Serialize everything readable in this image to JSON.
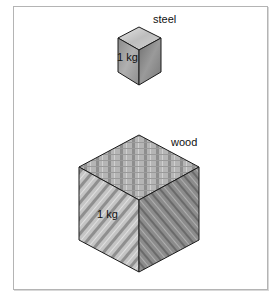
{
  "figure": {
    "objects": [
      {
        "material": "steel",
        "mass_label": "1 kg",
        "size": "small"
      },
      {
        "material": "wood",
        "mass_label": "1 kg",
        "size": "large"
      }
    ]
  },
  "labels": {
    "steel": "steel",
    "wood": "wood",
    "steel_mass": "1 kg",
    "wood_mass": "1 kg"
  },
  "colors": {
    "frame_border": "#b4b4b4",
    "edge": "#1a1a1a",
    "steel_top": "#c8c8c8",
    "steel_left": "#9a9a9a",
    "steel_right": "#7a7a7a",
    "wood_top": "#a8a8a8",
    "wood_left": "#b8b8b8",
    "wood_right": "#8c8c8c"
  }
}
